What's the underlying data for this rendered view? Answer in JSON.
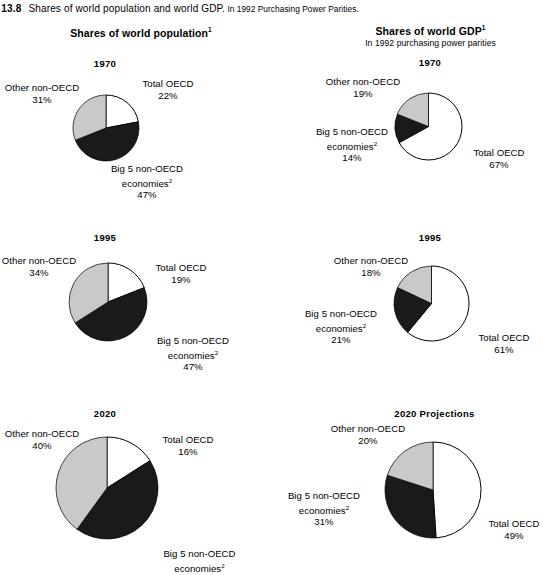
{
  "caption": {
    "figure_number": "ure 13.8",
    "main_text": "Shares of world population and world GDP.",
    "sub_text": " In 1992 Purchasing Power Parities."
  },
  "headers": {
    "population": "Shares of world population",
    "population_sup": "1",
    "gdp": "Shares of world GDP",
    "gdp_sup": "1",
    "gdp_subtitle": "In 1992 purchasing power parities"
  },
  "colors": {
    "total_oecd": "#ffffff",
    "big5_non_oecd": "#1a1a1a",
    "other_non_oecd": "#c9c9c9",
    "outline": "#000000"
  },
  "chart_data": [
    {
      "type": "pie",
      "id": "population-1970",
      "title": "1970",
      "panel": "Shares of world population",
      "categories": [
        "Total OECD",
        "Big 5 non-OECD economies",
        "Other non-OECD"
      ],
      "values": [
        22,
        47,
        31
      ],
      "labels": {
        "total_oecd_name": "Total OECD",
        "total_oecd_value": "22%",
        "big5_name": "Big 5 non-OECD",
        "big5_name2": "economies",
        "big5_sup": "2",
        "big5_value": "47%",
        "other_name": "Other non-OECD",
        "other_value": "31%"
      }
    },
    {
      "type": "pie",
      "id": "gdp-1970",
      "title": "1970",
      "panel": "Shares of world GDP",
      "categories": [
        "Total OECD",
        "Big 5 non-OECD economies",
        "Other non-OECD"
      ],
      "values": [
        67,
        14,
        19
      ],
      "labels": {
        "total_oecd_name": "Total OECD",
        "total_oecd_value": "67%",
        "big5_name": "Big 5 non-OECD",
        "big5_name2": "economies",
        "big5_sup": "2",
        "big5_value": "14%",
        "other_name": "Other non-OECD",
        "other_value": "19%"
      }
    },
    {
      "type": "pie",
      "id": "population-1995",
      "title": "1995",
      "panel": "Shares of world population",
      "categories": [
        "Total OECD",
        "Big 5 non-OECD economies",
        "Other non-OECD"
      ],
      "values": [
        19,
        47,
        34
      ],
      "labels": {
        "total_oecd_name": "Total OECD",
        "total_oecd_value": "19%",
        "big5_name": "Big 5 non-OECD",
        "big5_name2": "economies",
        "big5_sup": "2",
        "big5_value": "47%",
        "other_name": "Other non-OECD",
        "other_value": "34%"
      }
    },
    {
      "type": "pie",
      "id": "gdp-1995",
      "title": "1995",
      "panel": "Shares of world GDP",
      "categories": [
        "Total OECD",
        "Big 5 non-OECD economies",
        "Other non-OECD"
      ],
      "values": [
        61,
        21,
        18
      ],
      "labels": {
        "total_oecd_name": "Total OECD",
        "total_oecd_value": "61%",
        "big5_name": "Big 5 non-OECD",
        "big5_name2": "economies",
        "big5_sup": "2",
        "big5_value": "21%",
        "other_name": "Other non-OECD",
        "other_value": "18%"
      }
    },
    {
      "type": "pie",
      "id": "population-2020",
      "title": "2020",
      "panel": "Shares of world population",
      "categories": [
        "Total OECD",
        "Big 5 non-OECD economies",
        "Other non-OECD"
      ],
      "values": [
        16,
        44,
        40
      ],
      "labels": {
        "total_oecd_name": "Total OECD",
        "total_oecd_value": "16%",
        "big5_name": "Big 5 non-OECD",
        "big5_name2": "economies",
        "big5_sup": "2",
        "big5_value": "",
        "other_name": "Other non-OECD",
        "other_value": "40%"
      }
    },
    {
      "type": "pie",
      "id": "gdp-2020",
      "title": "2020 Projections",
      "panel": "Shares of world GDP",
      "categories": [
        "Total OECD",
        "Big 5 non-OECD economies",
        "Other non-OECD"
      ],
      "values": [
        49,
        31,
        20
      ],
      "labels": {
        "total_oecd_name": "Total OECD",
        "total_oecd_value": "49%",
        "big5_name": "Big 5 non-OECD",
        "big5_name2": "economies",
        "big5_sup": "2",
        "big5_value": "31%",
        "other_name": "Other non-OECD",
        "other_value": "20%"
      }
    }
  ]
}
